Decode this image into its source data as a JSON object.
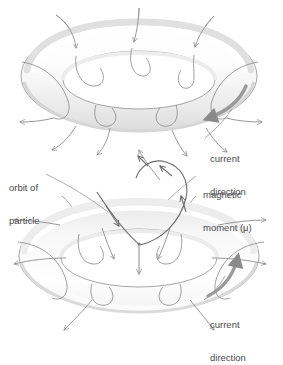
{
  "figure": {
    "background_color": "#ffffff",
    "line_color": "#8d8d8d",
    "dark_line_color": "#6b6b6b",
    "text_color": "#4a4a4a",
    "torus_fill_light": "#ffffff",
    "torus_fill_shade": "#e2e2e2",
    "torus_stroke": "#9a9a9a"
  },
  "labels": {
    "current_direction_top_line1": "current",
    "current_direction_top_line2": "direction",
    "orbit_of_particle_line1": "orbit of",
    "orbit_of_particle_line2": "particle",
    "magnetic_moment_line1": "magnetic",
    "magnetic_moment_line2": "moment (μ)",
    "current_direction_bottom_line1": "current",
    "current_direction_bottom_line2": "direction"
  },
  "diagrams": [
    {
      "name": "upper-torus",
      "center_x": 139,
      "center_y": 76,
      "ring_radius_x": 108,
      "ring_radius_y": 46,
      "tube_thickness": 20,
      "field_line_count": 8,
      "current_arrow": "clockwise-on-surface-right",
      "field_arrow_count": 8
    },
    {
      "name": "lower-torus",
      "center_x": 139,
      "center_y": 255,
      "ring_radius_x": 112,
      "ring_radius_y": 48,
      "tube_thickness": 21,
      "field_line_count": 8,
      "current_arrow": "counterclockwise-on-surface-right",
      "magnetic_moment_arrow": "downward-center",
      "orbit_arrow": "spiral-upward"
    }
  ]
}
